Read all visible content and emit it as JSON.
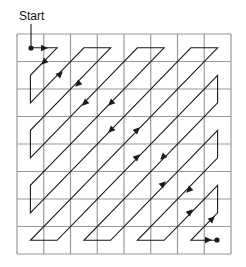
{
  "start_label": "Start",
  "grid": {
    "rows": 8,
    "cols": 8,
    "x": 17,
    "y": 34,
    "width": 214,
    "height": 220,
    "line_color": "#9a9a9a",
    "path_color": "#1a1a1a"
  },
  "start_marker": {
    "label_anchor": [
      31,
      24
    ],
    "dot": [
      31,
      48
    ]
  },
  "end_marker": {
    "dot": [
      217,
      240
    ]
  },
  "arrows": [
    {
      "x": 44,
      "y": 48,
      "dir": "e"
    },
    {
      "x": 44,
      "y": 62,
      "dir": "sw"
    },
    {
      "x": 60,
      "y": 74,
      "dir": "ne"
    },
    {
      "x": 78,
      "y": 84,
      "dir": "sw"
    },
    {
      "x": 85,
      "y": 103,
      "dir": "sw"
    },
    {
      "x": 111,
      "y": 103,
      "dir": "sw"
    },
    {
      "x": 111,
      "y": 130,
      "dir": "sw"
    },
    {
      "x": 137,
      "y": 130,
      "dir": "ne"
    },
    {
      "x": 137,
      "y": 157,
      "dir": "ne"
    },
    {
      "x": 163,
      "y": 157,
      "dir": "sw"
    },
    {
      "x": 163,
      "y": 184,
      "dir": "ne"
    },
    {
      "x": 189,
      "y": 190,
      "dir": "sw"
    },
    {
      "x": 190,
      "y": 212,
      "dir": "ne"
    },
    {
      "x": 212,
      "y": 219,
      "dir": "ne"
    },
    {
      "x": 208,
      "y": 240,
      "dir": "e"
    }
  ]
}
